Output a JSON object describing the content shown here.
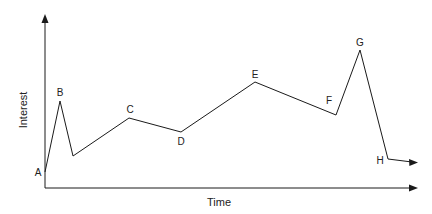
{
  "chart_data": {
    "type": "line",
    "title": "",
    "xlabel": "Time",
    "ylabel": "Interest",
    "grid": false,
    "legend": null,
    "axis_ticks": false,
    "points": [
      {
        "label": "A",
        "x": 0,
        "y": 10
      },
      {
        "label": "B",
        "x": 4,
        "y": 55
      },
      {
        "label": "",
        "x": 8,
        "y": 20
      },
      {
        "label": "C",
        "x": 23,
        "y": 44
      },
      {
        "label": "D",
        "x": 37,
        "y": 35
      },
      {
        "label": "E",
        "x": 56,
        "y": 67
      },
      {
        "label": "F",
        "x": 78,
        "y": 46
      },
      {
        "label": "G",
        "x": 84,
        "y": 87
      },
      {
        "label": "H",
        "x": 92,
        "y": 18
      },
      {
        "label": "",
        "x": 99,
        "y": 16
      }
    ],
    "annotations": [
      "A",
      "B",
      "C",
      "D",
      "E",
      "F",
      "G",
      "H"
    ],
    "line_end": "arrow"
  },
  "svg": {
    "stroke": "#1a1a1a",
    "axis_color": "#1a1a1a",
    "line_points": "45,172 60,101 73,156 129,118 181,132 255,82 336,115 360,50 388,159 412,162",
    "labels": [
      {
        "text": "A",
        "x": 38,
        "y": 176
      },
      {
        "text": "B",
        "x": 60,
        "y": 96
      },
      {
        "text": "C",
        "x": 130,
        "y": 113
      },
      {
        "text": "D",
        "x": 181,
        "y": 145
      },
      {
        "text": "E",
        "x": 255,
        "y": 78
      },
      {
        "text": "F",
        "x": 329,
        "y": 104
      },
      {
        "text": "G",
        "x": 360,
        "y": 46
      },
      {
        "text": "H",
        "x": 380,
        "y": 164
      }
    ]
  }
}
